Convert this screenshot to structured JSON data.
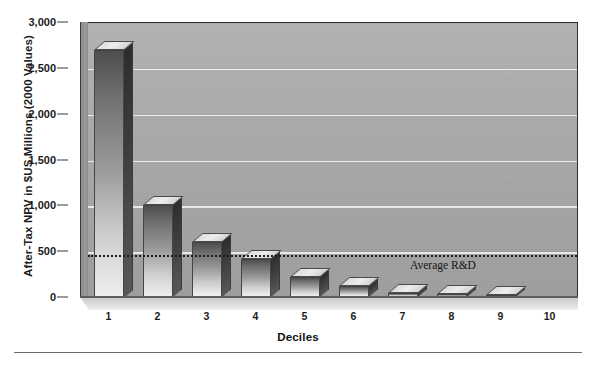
{
  "chart_data": {
    "type": "bar",
    "title": "",
    "xlabel": "Deciles",
    "ylabel": "After-Tax NPV in $US Millions (2000 Values)",
    "categories": [
      "1",
      "2",
      "3",
      "4",
      "5",
      "6",
      "7",
      "8",
      "9",
      "10"
    ],
    "values": [
      2700,
      1000,
      600,
      410,
      220,
      115,
      40,
      35,
      25,
      0
    ],
    "ylim": [
      0,
      3000
    ],
    "ytick_values": [
      0,
      500,
      1000,
      1500,
      2000,
      2500,
      3000
    ],
    "ytick_labels": [
      "0",
      "500",
      "1,000",
      "1,500",
      "2,000",
      "2,500",
      "3,000"
    ],
    "grid": true,
    "legend": "none",
    "annotations": [
      {
        "name": "average-rd-line",
        "label": "Average R&D",
        "value": 470,
        "style": "dotted-horizontal-line"
      }
    ],
    "style": {
      "palette": "grayscale",
      "bar_style": "3d-extruded",
      "plot_background": "#a6a6a6",
      "gridline_color": "#efefef",
      "bar_fill_top": "#4e4e4e",
      "bar_fill_bottom": "#efefef",
      "annotation_color": "#1d1d1d",
      "text_color": "#1b1b1b"
    }
  },
  "axes": {
    "y_title": "After-Tax NPV in $US Millions (2000 Values)",
    "x_title": "Deciles"
  }
}
